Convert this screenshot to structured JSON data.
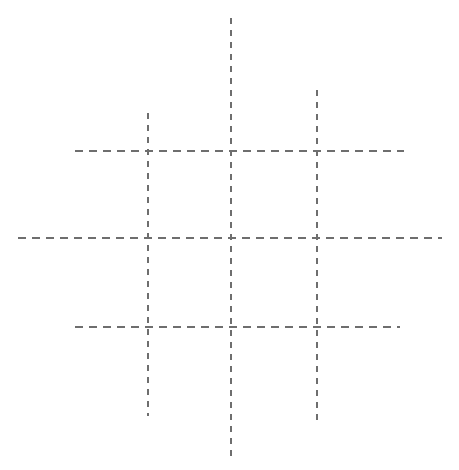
{
  "canvas": {
    "width": 459,
    "height": 470,
    "background_color": "#ffffff",
    "title": "Dashed Grid"
  },
  "style": {
    "line_color": "#6e6e6e",
    "line_width": 1.4,
    "vertical_dash_pattern": "6 6",
    "horizontal_dash_pattern": "8 6"
  },
  "chart_data": {
    "type": "line",
    "xlabel": "",
    "ylabel": "",
    "xlim": [
      0,
      459
    ],
    "ylim": [
      0,
      470
    ],
    "grid": true,
    "legend": "none",
    "series": [
      {
        "name": "vertical-line-left",
        "orientation": "vertical",
        "x": 148,
        "y_start": 113,
        "y_end": 416,
        "dash": "6 6",
        "color": "#6e6e6e"
      },
      {
        "name": "vertical-line-center",
        "orientation": "vertical",
        "x": 231,
        "y_start": 18,
        "y_end": 457,
        "dash": "6 6",
        "color": "#6e6e6e"
      },
      {
        "name": "vertical-line-right",
        "orientation": "vertical",
        "x": 317,
        "y_start": 90,
        "y_end": 424,
        "dash": "6 6",
        "color": "#6e6e6e"
      },
      {
        "name": "horizontal-line-top",
        "orientation": "horizontal",
        "y": 151,
        "x_start": 75,
        "x_end": 404,
        "dash": "8 6",
        "color": "#6e6e6e"
      },
      {
        "name": "horizontal-line-middle",
        "orientation": "horizontal",
        "y": 238,
        "x_start": 18,
        "x_end": 442,
        "dash": "8 6",
        "color": "#6e6e6e"
      },
      {
        "name": "horizontal-line-bottom",
        "orientation": "horizontal",
        "y": 327,
        "x_start": 75,
        "x_end": 400,
        "dash": "8 6",
        "color": "#6e6e6e"
      }
    ],
    "intersections": [
      {
        "name": "top-left",
        "x": 148,
        "y": 151
      },
      {
        "name": "top-center",
        "x": 231,
        "y": 151
      },
      {
        "name": "top-right",
        "x": 317,
        "y": 151
      },
      {
        "name": "middle-left",
        "x": 148,
        "y": 238
      },
      {
        "name": "middle-center",
        "x": 231,
        "y": 238
      },
      {
        "name": "middle-right",
        "x": 317,
        "y": 238
      },
      {
        "name": "bottom-left",
        "x": 148,
        "y": 327
      },
      {
        "name": "bottom-center",
        "x": 231,
        "y": 327
      },
      {
        "name": "bottom-right",
        "x": 317,
        "y": 327
      }
    ]
  }
}
